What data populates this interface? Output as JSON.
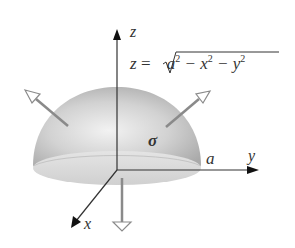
{
  "diagram": {
    "equation": {
      "lhs": "z",
      "eq": "=",
      "radical": "a² − x² − y²",
      "parts": [
        "a",
        "2",
        " − x",
        "2",
        " − y",
        "2"
      ]
    },
    "axes": {
      "x_label": "x",
      "y_label": "y",
      "z_label": "z"
    },
    "surface_label": "σ",
    "radius_label": "a",
    "normals": [
      {
        "name": "upper-left-normal",
        "direction": "outward"
      },
      {
        "name": "upper-right-normal",
        "direction": "outward"
      },
      {
        "name": "bottom-normal",
        "direction": "downward"
      }
    ],
    "colors": {
      "dome_dark": "#a8a8a8",
      "dome_light": "#f0f0f0",
      "base": "#d8d8d8",
      "axis": "#333333",
      "normal_arrow": "#8a8a8a"
    }
  }
}
